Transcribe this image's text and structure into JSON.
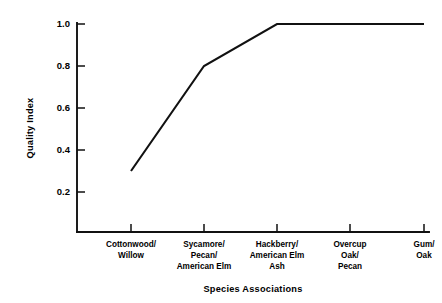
{
  "chart_data": {
    "type": "line",
    "title": "",
    "xlabel": "Species Associations",
    "ylabel": "Quality Index",
    "categories": [
      "Cottonwood/\nWillow",
      "Sycamore/\nPecan/\nAmerican Elm",
      "Hackberry/\nAmerican Elm\nAsh",
      "Overcup\nOak/\nPecan",
      "Gum/\nOak"
    ],
    "category_lines": [
      [
        "Cottonwood/",
        "Willow"
      ],
      [
        "Sycamore/",
        "Pecan/",
        "American Elm"
      ],
      [
        "Hackberry/",
        "American Elm",
        "Ash"
      ],
      [
        "Overcup",
        "Oak/",
        "Pecan"
      ],
      [
        "Gum/",
        "Oak"
      ]
    ],
    "values": [
      0.3,
      0.8,
      1.0,
      1.0,
      1.0
    ],
    "ylim": [
      0.0,
      1.0
    ],
    "yticks": [
      0.2,
      0.4,
      0.6,
      0.8,
      1.0
    ],
    "ytick_labels": [
      "0.2",
      "0.4",
      "0.6",
      "0.8",
      "1.0"
    ],
    "grid": false,
    "legend": false,
    "legend_position": "none",
    "line_color": "#111111",
    "background_color": "#ffffff"
  }
}
